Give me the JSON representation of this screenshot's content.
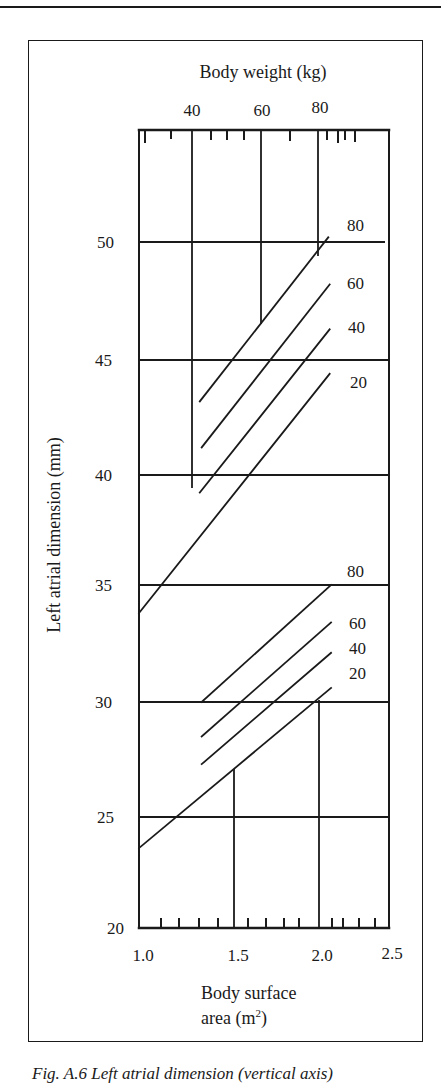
{
  "chart_data": {
    "type": "line",
    "title": "",
    "top_axis": {
      "label": "Body weight (kg)",
      "ticks": [
        "40",
        "60",
        "80"
      ]
    },
    "xlabel": "Body surface area (m²)",
    "xlabel_lines": [
      "Body surface",
      "area (m",
      "2",
      ")"
    ],
    "ylabel": "Left atrial dimension (mm)",
    "xlim": [
      1.0,
      2.5
    ],
    "ylim": [
      20,
      50
    ],
    "x_ticks": [
      "1.0",
      "1.5",
      "2.0",
      "2.5"
    ],
    "y_ticks": [
      "20",
      "25",
      "30",
      "35",
      "40",
      "45",
      "50"
    ],
    "grid": true,
    "legend_position": "inline-right",
    "series_groups": [
      {
        "group": "upper limit",
        "series": [
          {
            "name": "80",
            "x": [
              1.32,
              2.06
            ],
            "y": [
              43.2,
              50.2
            ]
          },
          {
            "name": "60",
            "x": [
              1.33,
              2.07
            ],
            "y": [
              41.2,
              48.2
            ]
          },
          {
            "name": "40",
            "x": [
              1.32,
              2.07
            ],
            "y": [
              39.2,
              46.3
            ]
          },
          {
            "name": "20",
            "x": [
              1.0,
              2.07
            ],
            "y": [
              33.8,
              44.4
            ]
          }
        ]
      },
      {
        "group": "lower limit",
        "series": [
          {
            "name": "80",
            "x": [
              1.33,
              2.08
            ],
            "y": [
              30.0,
              35.0
            ]
          },
          {
            "name": "60",
            "x": [
              1.33,
              2.08
            ],
            "y": [
              28.5,
              33.4
            ]
          },
          {
            "name": "40",
            "x": [
              1.33,
              2.08
            ],
            "y": [
              27.3,
              32.1
            ]
          },
          {
            "name": "20",
            "x": [
              1.0,
              2.08
            ],
            "y": [
              23.6,
              30.6
            ]
          }
        ]
      }
    ]
  },
  "caption": "Fig. A.6 Left atrial dimension (vertical axis)"
}
